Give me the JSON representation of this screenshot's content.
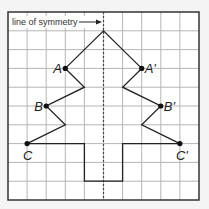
{
  "diagram": {
    "annotation": "line of symmetry",
    "grid": {
      "cols": 10,
      "rows": 10,
      "left": 8,
      "top": 12,
      "right": 199,
      "bottom": 200
    },
    "colors": {
      "background": "#ffffff",
      "grid": "#b5b5b5",
      "border": "#333333",
      "shape": "#222222",
      "symmetry_line": "#444444"
    },
    "points": [
      {
        "name": "A",
        "label": "A",
        "col": 3,
        "row": 3
      },
      {
        "name": "A-prime",
        "label": "A'",
        "col": 7,
        "row": 3
      },
      {
        "name": "B",
        "label": "B",
        "col": 2,
        "row": 5
      },
      {
        "name": "B-prime",
        "label": "B'",
        "col": 8,
        "row": 5
      },
      {
        "name": "C",
        "label": "C",
        "col": 1,
        "row": 7
      },
      {
        "name": "C-prime",
        "label": "C'",
        "col": 9,
        "row": 7
      }
    ],
    "outline": [
      [
        1,
        7
      ],
      [
        2,
        5
      ],
      [
        3,
        6
      ],
      [
        3,
        6
      ],
      [
        2,
        5
      ],
      [
        3,
        3
      ],
      [
        4,
        4
      ],
      [
        3,
        3
      ],
      [
        5,
        1
      ],
      [
        7,
        3
      ],
      [
        6,
        4
      ],
      [
        8,
        5
      ],
      [
        7,
        6
      ],
      [
        9,
        7
      ]
    ],
    "trunk": [
      [
        1,
        7
      ],
      [
        4,
        7
      ],
      [
        4,
        9
      ],
      [
        6,
        9
      ],
      [
        6,
        7
      ],
      [
        9,
        7
      ]
    ],
    "symmetry_col": 5
  }
}
